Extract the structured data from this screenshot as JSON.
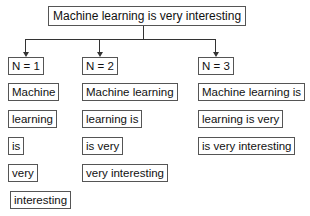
{
  "root": {
    "label": "Machine learning is very interesting"
  },
  "columns": [
    {
      "header": "N = 1",
      "items": [
        "Machine",
        "learning",
        "is",
        "very",
        "interesting"
      ]
    },
    {
      "header": "N = 2",
      "items": [
        "Machine learning",
        "learning is",
        "is very",
        "very interesting"
      ]
    },
    {
      "header": "N = 3",
      "items": [
        "Machine learning is",
        "learning is very",
        "is very interesting"
      ]
    }
  ]
}
